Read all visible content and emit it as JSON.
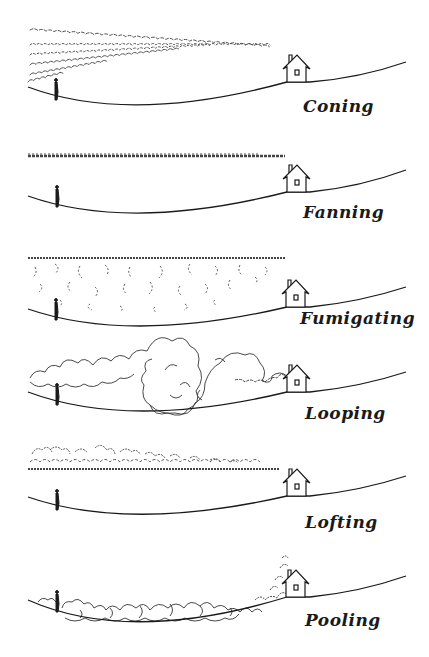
{
  "figure": {
    "panels": [
      {
        "id": "coning",
        "label": "Coning",
        "top": 0
      },
      {
        "id": "fanning",
        "label": "Fanning",
        "top": 112
      },
      {
        "id": "fumigating",
        "label": "Fumigating",
        "top": 222
      },
      {
        "id": "looping",
        "label": "Looping",
        "top": 330
      },
      {
        "id": "lofting",
        "label": "Lofting",
        "top": 432
      },
      {
        "id": "pooling",
        "label": "Pooling",
        "top": 540
      }
    ],
    "elements": {
      "person": "person-figure",
      "house": "house-with-chimney",
      "terrain": "valley-ground-line"
    },
    "colors": {
      "ink": "#1a1a1a",
      "paper": "#ffffff",
      "smoke": "#444444"
    }
  }
}
